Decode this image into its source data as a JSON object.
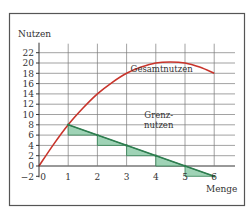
{
  "chart_data": {
    "type": "line",
    "title": "",
    "xlabel": "Menge",
    "ylabel": "Nutzen",
    "xlim": [
      0,
      6
    ],
    "ylim": [
      -2,
      22
    ],
    "x_ticks": [
      "0",
      "1",
      "2",
      "3",
      "4",
      "5",
      "6"
    ],
    "y_ticks": [
      "22",
      "20",
      "18",
      "16",
      "14",
      "12",
      "10",
      "8",
      "6",
      "4",
      "2",
      "0",
      "−2"
    ],
    "y_tick_values": [
      22,
      20,
      18,
      16,
      14,
      12,
      10,
      8,
      6,
      4,
      2,
      0,
      -2
    ],
    "grid": true,
    "series": [
      {
        "name": "Gesamtnutzen",
        "color": "#c8342b",
        "x": [
          0,
          0.5,
          1,
          1.5,
          2,
          2.5,
          3,
          3.5,
          4,
          4.5,
          5,
          5.5,
          6
        ],
        "values": [
          0,
          4.2,
          8,
          11.2,
          14,
          16.2,
          18,
          19.2,
          20,
          20.2,
          20,
          19.2,
          18
        ]
      },
      {
        "name": "Grenznutzen",
        "color": "#2e7d4f",
        "x": [
          1,
          6
        ],
        "values": [
          8,
          -2
        ]
      }
    ],
    "marginal_steps": {
      "fill": "#9fd3b6",
      "stroke": "#2e7d4f",
      "x": [
        1,
        2,
        3,
        4,
        5
      ],
      "values": [
        8,
        6,
        4,
        2,
        0
      ]
    },
    "annotations": [
      {
        "text": "Gesamtnutzen",
        "x": 4.2,
        "y": 18.3
      },
      {
        "text": "Grenz-",
        "x": 4.1,
        "y": 9.3
      },
      {
        "text": "nutzen",
        "x": 4.1,
        "y": 7.3
      }
    ]
  }
}
